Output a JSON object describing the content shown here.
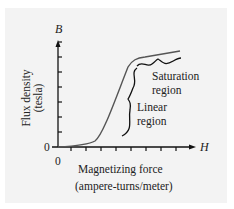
{
  "chart_data": {
    "type": "line",
    "title": "",
    "xlabel": "Magnetizing force",
    "xlabel_unit": "(ampere-turns/meter)",
    "ylabel": "Flux density",
    "ylabel_unit": "(tesla)",
    "x_axis_symbol": "H",
    "y_axis_symbol": "B",
    "origin_label_x": "0",
    "origin_label_y": "0",
    "x_ticks": 8,
    "y_ticks": 7,
    "tick_labels": "none (unlabeled ticks)",
    "grid": false,
    "legend": "none",
    "series": [
      {
        "name": "B-H magnetization curve",
        "description": "Relative units: H in tick units (0-8+), B in tick units (0-7+)",
        "x": [
          0,
          1,
          2,
          2.5,
          3,
          3.5,
          4,
          4.3,
          4.7,
          5,
          6,
          7,
          8
        ],
        "y": [
          0,
          0.1,
          0.3,
          0.8,
          2.0,
          3.5,
          5.0,
          5.8,
          6.2,
          6.3,
          6.5,
          6.7,
          6.9
        ]
      }
    ],
    "annotations": [
      {
        "text_lines": [
          "Saturation",
          "region"
        ],
        "brace": "horizontal, under flat upper portion of curve"
      },
      {
        "text_lines": [
          "Linear",
          "region"
        ],
        "brace": "vertical, beside steep middle portion of curve"
      }
    ]
  },
  "labels": {
    "y_symbol": "B",
    "x_symbol": "H",
    "y_title": "Flux density",
    "y_unit": "(tesla)",
    "x_title": "Magnetizing force",
    "x_unit": "(ampere-turns/meter)",
    "origin_y": "0",
    "origin_x": "0",
    "saturation_line1": "Saturation",
    "saturation_line2": "region",
    "linear_line1": "Linear",
    "linear_line2": "region"
  },
  "colors": {
    "curve": "#555555",
    "axis": "#111111",
    "panel": "#f3f3f3",
    "text": "#222222"
  }
}
